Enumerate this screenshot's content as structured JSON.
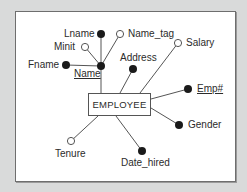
{
  "diagram": {
    "type": "er-attribute-diagram",
    "entity": {
      "name": "EMPLOYEE"
    },
    "legend_meaning": {
      "filled_dot": "required attribute",
      "hollow_circle": "optional attribute"
    },
    "attributes": [
      {
        "id": "name",
        "label": "Name",
        "key": true,
        "required": true,
        "composite": true
      },
      {
        "id": "fname",
        "label": "Fname",
        "key": false,
        "required": true,
        "part_of": "name"
      },
      {
        "id": "minit",
        "label": "Minit",
        "key": false,
        "required": false,
        "part_of": "name"
      },
      {
        "id": "lname",
        "label": "Lname",
        "key": false,
        "required": true,
        "part_of": "name"
      },
      {
        "id": "name_tag",
        "label": "Name_tag",
        "key": false,
        "required": false,
        "part_of": "name"
      },
      {
        "id": "address",
        "label": "Address",
        "key": false,
        "required": true
      },
      {
        "id": "salary",
        "label": "Salary",
        "key": false,
        "required": false
      },
      {
        "id": "emp_no",
        "label": "Emp#",
        "key": true,
        "required": true
      },
      {
        "id": "gender",
        "label": "Gender",
        "key": false,
        "required": true
      },
      {
        "id": "date_hired",
        "label": "Date_hired",
        "key": false,
        "required": true
      },
      {
        "id": "tenure",
        "label": "Tenure",
        "key": false,
        "required": false
      }
    ]
  },
  "colors": {
    "background": "#d9dada",
    "panel": "#ffffff",
    "line": "#555555",
    "dot": "#1a1a1a"
  }
}
